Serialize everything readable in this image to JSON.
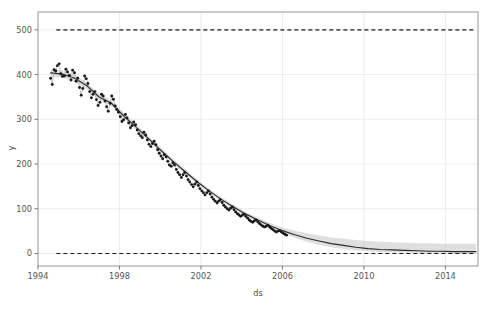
{
  "chart_data": {
    "type": "line",
    "title": "",
    "xlabel": "ds",
    "ylabel": "y",
    "xlim": [
      1994.0,
      2015.6
    ],
    "ylim": [
      -28,
      540
    ],
    "grid": true,
    "legend": "none",
    "xticks": [
      1994,
      1998,
      2002,
      2006,
      2010,
      2014
    ],
    "xticklabels": [
      "1994",
      "1998",
      "2002",
      "2006",
      "2010",
      "2014"
    ],
    "yticks": [
      0,
      100,
      200,
      300,
      400,
      500
    ],
    "yticklabels": [
      "0",
      "100",
      "200",
      "300",
      "400",
      "500"
    ],
    "annotations": [
      {
        "name": "cap-line",
        "type": "hline",
        "y": 500,
        "style": "dashed",
        "color": "#1a1a1a"
      },
      {
        "name": "floor-line",
        "type": "hline",
        "y": 0,
        "style": "dashed",
        "color": "#1a1a1a"
      }
    ],
    "series": [
      {
        "name": "observations",
        "style": "scatter",
        "color": "#1a1a1a",
        "x": [
          1994.62,
          1994.7,
          1994.79,
          1994.87,
          1994.95,
          1995.04,
          1995.12,
          1995.2,
          1995.29,
          1995.37,
          1995.45,
          1995.54,
          1995.62,
          1995.7,
          1995.79,
          1995.87,
          1995.95,
          1996.04,
          1996.12,
          1996.2,
          1996.29,
          1996.37,
          1996.45,
          1996.54,
          1996.62,
          1996.7,
          1996.79,
          1996.87,
          1996.95,
          1997.04,
          1997.12,
          1997.2,
          1997.29,
          1997.37,
          1997.45,
          1997.54,
          1997.62,
          1997.7,
          1997.79,
          1997.87,
          1997.95,
          1998.04,
          1998.12,
          1998.2,
          1998.29,
          1998.37,
          1998.45,
          1998.54,
          1998.62,
          1998.7,
          1998.79,
          1998.87,
          1998.95,
          1999.04,
          1999.12,
          1999.2,
          1999.29,
          1999.37,
          1999.45,
          1999.54,
          1999.62,
          1999.7,
          1999.79,
          1999.87,
          1999.95,
          2000.04,
          2000.12,
          2000.2,
          2000.29,
          2000.37,
          2000.45,
          2000.54,
          2000.62,
          2000.7,
          2000.79,
          2000.87,
          2000.95,
          2001.04,
          2001.12,
          2001.2,
          2001.29,
          2001.37,
          2001.45,
          2001.54,
          2001.62,
          2001.7,
          2001.79,
          2001.87,
          2001.95,
          2002.04,
          2002.12,
          2002.2,
          2002.29,
          2002.37,
          2002.45,
          2002.54,
          2002.62,
          2002.7,
          2002.79,
          2002.87,
          2002.95,
          2003.04,
          2003.12,
          2003.2,
          2003.29,
          2003.37,
          2003.45,
          2003.54,
          2003.62,
          2003.7,
          2003.79,
          2003.87,
          2003.95,
          2004.04,
          2004.12,
          2004.2,
          2004.29,
          2004.37,
          2004.45,
          2004.54,
          2004.62,
          2004.7,
          2004.79,
          2004.87,
          2004.95,
          2005.04,
          2005.12,
          2005.2,
          2005.29,
          2005.37,
          2005.45,
          2005.54,
          2005.62,
          2005.7,
          2005.79,
          2005.87,
          2005.95,
          2006.04,
          2006.12,
          2006.2
        ],
        "y": [
          392,
          378,
          411,
          408,
          420,
          424,
          402,
          396,
          397,
          412,
          406,
          398,
          388,
          410,
          404,
          385,
          392,
          371,
          354,
          369,
          397,
          391,
          380,
          362,
          348,
          356,
          362,
          344,
          331,
          338,
          356,
          352,
          341,
          328,
          318,
          336,
          352,
          345,
          330,
          322,
          316,
          306,
          295,
          299,
          311,
          303,
          292,
          281,
          286,
          294,
          288,
          276,
          268,
          263,
          259,
          271,
          265,
          254,
          244,
          239,
          246,
          251,
          243,
          232,
          224,
          218,
          212,
          221,
          216,
          206,
          198,
          195,
          203,
          198,
          188,
          181,
          176,
          170,
          176,
          181,
          173,
          165,
          160,
          154,
          149,
          155,
          160,
          152,
          145,
          140,
          136,
          131,
          136,
          140,
          133,
          126,
          121,
          117,
          113,
          117,
          120,
          114,
          108,
          104,
          100,
          97,
          101,
          104,
          98,
          93,
          89,
          86,
          83,
          86,
          88,
          83,
          79,
          75,
          72,
          70,
          73,
          75,
          71,
          67,
          64,
          61,
          59,
          61,
          63,
          59,
          56,
          53,
          50,
          48,
          50,
          51,
          48,
          45,
          43,
          41
        ]
      },
      {
        "name": "forecast-yhat",
        "style": "line",
        "color": "#2b2b2b",
        "x": [
          1994.62,
          1995.2,
          1995.8,
          1996.4,
          1997.0,
          1997.6,
          1998.2,
          1998.8,
          1999.4,
          2000.0,
          2000.6,
          2001.2,
          2001.8,
          2002.4,
          2003.0,
          2003.6,
          2004.2,
          2004.8,
          2005.4,
          2006.0,
          2006.6,
          2007.2,
          2007.8,
          2008.4,
          2009.0,
          2009.6,
          2010.2,
          2010.8,
          2011.4,
          2012.0,
          2012.6,
          2013.2,
          2013.8,
          2014.4,
          2015.0,
          2015.5
        ],
        "y": [
          404,
          401,
          392,
          375,
          350,
          336,
          308,
          283,
          258,
          232,
          207,
          184,
          161,
          140,
          121,
          104,
          88,
          75,
          62,
          51,
          42,
          34,
          28,
          22,
          18,
          14,
          11,
          9,
          8,
          7,
          6,
          5,
          5,
          4,
          4,
          4
        ]
      },
      {
        "name": "uncertainty-band",
        "style": "band",
        "color": "#b9b9b9",
        "opacity": 0.45,
        "x": [
          1994.62,
          1995.2,
          1995.8,
          1996.4,
          1997.0,
          1997.6,
          1998.2,
          1998.8,
          1999.4,
          2000.0,
          2000.6,
          2001.2,
          2001.8,
          2002.4,
          2003.0,
          2003.6,
          2004.2,
          2004.8,
          2005.4,
          2006.0,
          2006.6,
          2007.2,
          2007.8,
          2008.4,
          2009.0,
          2009.6,
          2010.2,
          2010.8,
          2011.4,
          2012.0,
          2012.6,
          2013.2,
          2013.8,
          2014.4,
          2015.0,
          2015.5
        ],
        "y_lower": [
          396,
          393,
          384,
          368,
          343,
          329,
          301,
          277,
          252,
          226,
          201,
          178,
          156,
          135,
          116,
          99,
          83,
          70,
          57,
          45,
          35,
          26,
          19,
          14,
          10,
          7,
          5,
          3,
          2,
          2,
          1,
          1,
          1,
          0,
          0,
          0
        ],
        "y_upper": [
          412,
          409,
          400,
          382,
          357,
          343,
          315,
          289,
          264,
          238,
          213,
          190,
          166,
          145,
          126,
          109,
          93,
          80,
          68,
          58,
          51,
          45,
          40,
          36,
          33,
          30,
          28,
          26,
          25,
          24,
          23,
          23,
          22,
          22,
          22,
          22
        ]
      }
    ]
  },
  "figure": {
    "background": "#ffffff",
    "axes_background": "#ffffff",
    "spine_color": "#8a8a8a",
    "grid_color": "#e8e8e8",
    "tick_color": "#6a6a6a",
    "plot_left": 38,
    "plot_right": 478,
    "plot_top": 12,
    "plot_bottom": 266
  }
}
